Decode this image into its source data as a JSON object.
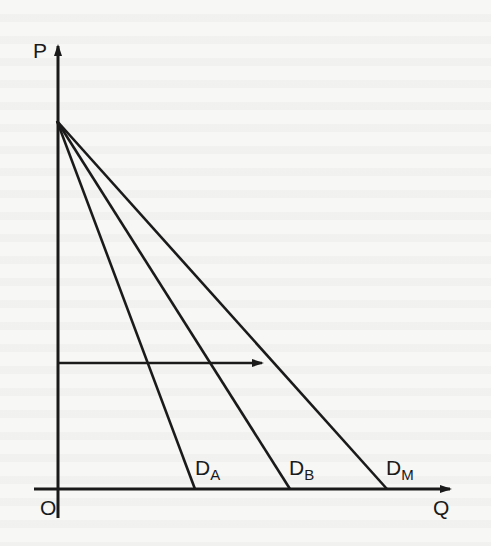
{
  "diagram": {
    "type": "demand-curves",
    "axes": {
      "y_label": "P",
      "x_label": "Q",
      "origin_label": "O"
    },
    "curves": [
      {
        "name": "D",
        "subscript": "A",
        "from": [
          57,
          121
        ],
        "to": [
          195,
          489
        ]
      },
      {
        "name": "D",
        "subscript": "B",
        "from": [
          57,
          121
        ],
        "to": [
          290,
          489
        ]
      },
      {
        "name": "D",
        "subscript": "M",
        "from": [
          57,
          121
        ],
        "to": [
          387,
          489
        ]
      }
    ],
    "horizontal_arrow": {
      "from": [
        58,
        363
      ],
      "to": [
        262,
        363
      ]
    },
    "colors": {
      "ink": "#1a1a1a",
      "paper": "#f7f7f5"
    }
  }
}
